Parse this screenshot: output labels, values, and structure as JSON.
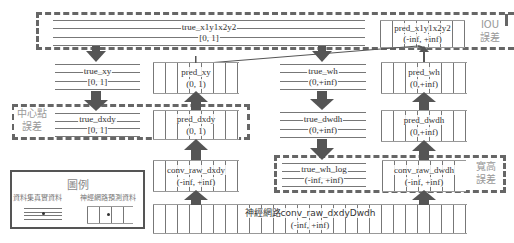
{
  "diagram": {
    "boxes": {
      "true_x1y1x2y2": {
        "name": "true_x1y1x2y2",
        "range": "[0, 1]"
      },
      "pred_x1y1x2y2": {
        "name": "pred_x1y1x2y2",
        "range": "(-inf, +inf)"
      },
      "true_xy": {
        "name": "true_xy",
        "range": "[0, 1]"
      },
      "pred_xy": {
        "name": "pred_xy",
        "range": "(0, 1)"
      },
      "true_wh": {
        "name": "true_wh",
        "range": "(0,+inf)"
      },
      "pred_wh": {
        "name": "pred_wh",
        "range": "(0,+inf)"
      },
      "true_dxdy": {
        "name": "true_dxdy",
        "range": "[0, 1]"
      },
      "pred_dxdy": {
        "name": "pred_dxdy",
        "range": "(0, 1)"
      },
      "true_dwdh": {
        "name": "true_dwdh",
        "range": "(0,+inf)"
      },
      "pred_dwdh": {
        "name": "pred_dwdh",
        "range": "(0,+inf)"
      },
      "conv_raw_dxdy": {
        "name": "conv_raw_dxdy",
        "range": "(-inf, +inf)"
      },
      "true_wh_log": {
        "name": "true_wh_log",
        "range": "(-inf, +inf)"
      },
      "conv_raw_dwdh": {
        "name": "conv_raw_dwdh",
        "range": "(-inf, +inf)"
      },
      "conv_raw_dxdyDwdh": {
        "name": "神經網路conv_raw_dxdyDwdh",
        "range": "(-inf, +inf)"
      }
    },
    "groups": {
      "iou": {
        "line1": "IOU",
        "line2": "誤差"
      },
      "center": {
        "line1": "中心點",
        "line2": "誤差"
      },
      "wh": {
        "line1": "寬高",
        "line2": "誤差"
      }
    },
    "legend": {
      "title": "圖例",
      "ground_truth_label": "資料集真實資料",
      "prediction_label": "神經網路預測資料"
    },
    "colors": {
      "arrow": "#555555",
      "dashed_border": "#666666",
      "group_label": "#999999"
    }
  }
}
